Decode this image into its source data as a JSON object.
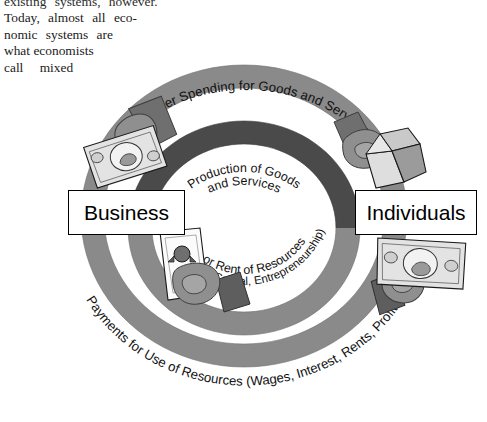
{
  "page": {
    "background": "#ffffff",
    "width": 487,
    "height": 422
  },
  "body_text": {
    "lines": [
      "existing  systems,  however.",
      "Today,  almost  all  eco-",
      "nomic  systems  are",
      "what economists",
      "call    mixed"
    ]
  },
  "diagram": {
    "entities": [
      {
        "id": "business",
        "label": "Business"
      },
      {
        "id": "individuals",
        "label": "Individuals"
      }
    ],
    "flow_labels": {
      "outer_top": "Consumer Spending for Goods and Services",
      "inner_top_line1": "Production of Goods",
      "inner_top_line2": "and Services",
      "inner_bottom_line1": "Sale or Rent of Resources",
      "inner_bottom_line2": "(Land, Labor, Capital, Entrepreneurship)",
      "outer_bottom": "Payments for Use of Resources (Wages, Interest, Rents, Profits)"
    },
    "colors": {
      "outer_ring": "#8a8a8a",
      "inner_ring_dark": "#4a4a4a",
      "inner_ring_light": "#8a8a8a",
      "outline": "#000000",
      "box_fill": "#ffffff",
      "hand_dark": "#7a7a7a",
      "hand_light": "#b5b5b5",
      "paper": "#e8e8e8",
      "text": "#111111"
    },
    "illustrations": [
      {
        "id": "top-left",
        "name": "hand-holding-banknote",
        "depicts": "money"
      },
      {
        "id": "top-right",
        "name": "hand-holding-package",
        "depicts": "goods"
      },
      {
        "id": "bottom-left",
        "name": "hand-holding-document",
        "depicts": "resource deed"
      },
      {
        "id": "bottom-right",
        "name": "hand-holding-banknote",
        "depicts": "money"
      }
    ]
  }
}
